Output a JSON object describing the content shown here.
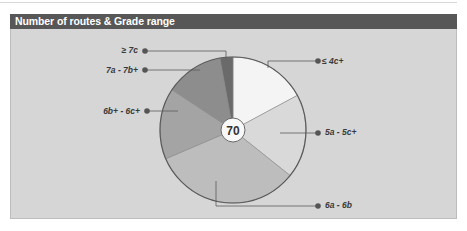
{
  "header": {
    "title": "Number of routes & Grade range"
  },
  "chart_data": {
    "type": "pie",
    "title": "Number of routes & Grade range",
    "total": 70,
    "categories": [
      "≤ 4c+",
      "5a - 5c+",
      "6a - 6b",
      "6b+ - 6c+",
      "7a - 7b+",
      "≥ 7c"
    ],
    "values": [
      12,
      13,
      23,
      11,
      9,
      2
    ],
    "colors": [
      "#f4f4f4",
      "#d9d9d9",
      "#bdbdbd",
      "#a4a4a4",
      "#8d8d8d",
      "#6a6a6a"
    ],
    "legend_position": "callouts",
    "center_label": "70"
  },
  "labels": {
    "s0": "≤ 4c+",
    "s1": "5a - 5c+",
    "s2": "6a - 6b",
    "s3": "6b+ - 6c+",
    "s4": "7a - 7b+",
    "s5": "≥ 7c",
    "total": "70"
  }
}
